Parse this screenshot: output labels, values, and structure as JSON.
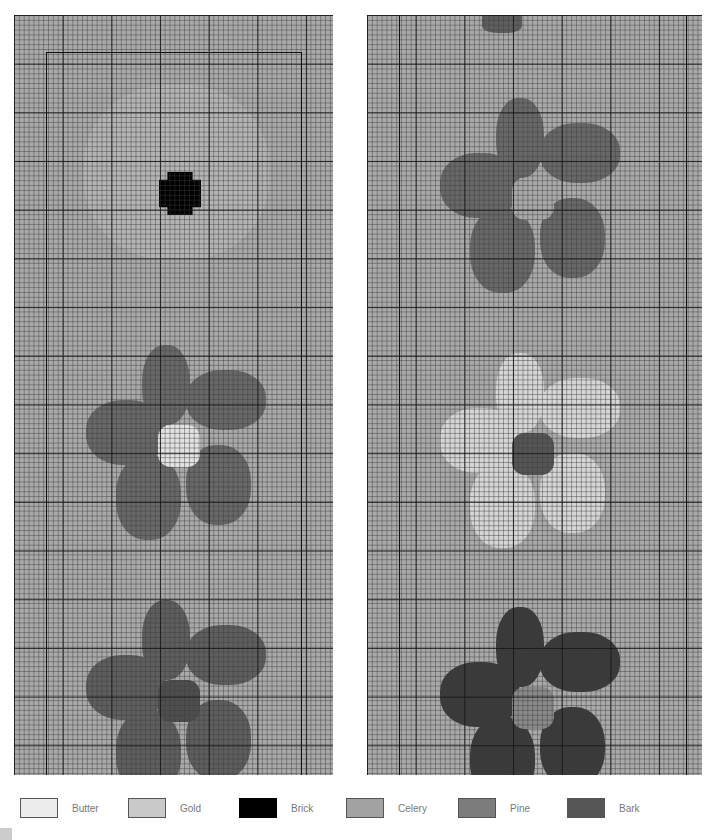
{
  "colors": {
    "background": "#a9a9a9",
    "faint_region": "#b8b8b8",
    "Butter": "#ececec",
    "Gold": "#c9c9c9",
    "Brick": "#000000",
    "Celery": "#a2a2a2",
    "Pine": "#7c7c7c",
    "Bark": "#555555",
    "flower_dark": "#686868",
    "flower_darker": "#3c3c3c"
  },
  "legend": {
    "items": [
      {
        "label": "Butter",
        "color": "#ececec"
      },
      {
        "label": "Gold",
        "color": "#c9c9c9"
      },
      {
        "label": "Brick",
        "color": "#000000"
      },
      {
        "label": "Celery",
        "color": "#a2a2a2"
      },
      {
        "label": "Pine",
        "color": "#7c7c7c"
      },
      {
        "label": "Bark",
        "color": "#555555"
      }
    ]
  },
  "panels": [
    {
      "name": "left-chart",
      "flowers": [
        {
          "petal": "#b2b2b2",
          "center": "#000000"
        },
        {
          "petal": "#686868",
          "center": "#e2e2e2"
        },
        {
          "petal": "#5e5e5e",
          "center": "#4e4e4e"
        }
      ]
    },
    {
      "name": "right-chart",
      "flowers": [
        {
          "petal": "#5e5e5e",
          "center": "#5e5e5e"
        },
        {
          "petal": "#686868",
          "center": "#a9a9a9"
        },
        {
          "petal": "#d6d6d6",
          "center": "#555555"
        },
        {
          "petal": "#3a3a3a",
          "center": "#8a8a8a"
        }
      ]
    }
  ]
}
